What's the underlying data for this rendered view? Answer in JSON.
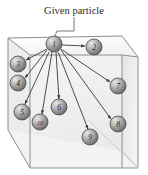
{
  "figure": {
    "title": "Given particle",
    "type": "3d-cube-particle-interaction-diagram",
    "width": 148,
    "height": 175,
    "colors": {
      "background": "#ffffff",
      "cube_stroke": "#8c8c8c",
      "cube_face_front": "#f0f0f0",
      "cube_face_top": "#fbfbfb",
      "cube_face_side": "#e6e6e6",
      "arrow": "#3a3a3a",
      "leader_line": "#6a6a6a",
      "sphere_light": "#dcdcdc",
      "sphere_mid": "#a8a8a8",
      "sphere_dark": "#6f6f6f",
      "sphere_stroke": "#4a4a4a",
      "text": "#2b2b2b"
    }
  },
  "caption": {
    "label": "Given particle",
    "x": 74,
    "y": 12
  },
  "leader": {
    "from_x": 74,
    "from_y": 17,
    "to_x": 56,
    "to_y": 36
  },
  "cube": {
    "front_face": [
      [
        30,
        55
      ],
      [
        122,
        55
      ],
      [
        122,
        168
      ],
      [
        30,
        168
      ]
    ],
    "back_face": [
      [
        8,
        38
      ],
      [
        122,
        36
      ],
      [
        138,
        57
      ],
      [
        138,
        168
      ]
    ],
    "vertices": {
      "front_top_left": [
        30,
        55
      ],
      "front_top_right": [
        122,
        55
      ],
      "front_bottom_left": [
        30,
        168
      ],
      "front_bottom_right": [
        122,
        168
      ],
      "back_top_left": [
        8,
        38
      ],
      "back_top_right": [
        122,
        36
      ],
      "back_bottom_left": [
        8,
        130
      ],
      "back_bottom_right": [
        138,
        57
      ]
    }
  },
  "source_node": {
    "id": "1",
    "label": "1",
    "cx": 54,
    "cy": 44,
    "r": 8
  },
  "target_nodes": [
    {
      "id": "2",
      "label": "2",
      "cx": 94,
      "cy": 47,
      "r": 8
    },
    {
      "id": "3",
      "label": "3",
      "cx": 18,
      "cy": 64,
      "r": 8
    },
    {
      "id": "4",
      "label": "4",
      "cx": 18,
      "cy": 83,
      "r": 8
    },
    {
      "id": "5",
      "label": "5",
      "cx": 22,
      "cy": 112,
      "r": 8
    },
    {
      "id": "6",
      "label": "6",
      "cx": 59,
      "cy": 107,
      "r": 8
    },
    {
      "id": "7",
      "label": "7",
      "cx": 118,
      "cy": 86,
      "r": 8
    },
    {
      "id": "8",
      "label": "8",
      "cx": 118,
      "cy": 124,
      "r": 8
    },
    {
      "id": "9",
      "label": "9",
      "cx": 90,
      "cy": 137,
      "r": 8
    },
    {
      "id": "10",
      "label": "10",
      "cx": 40,
      "cy": 122,
      "r": 8
    }
  ],
  "arrows": [
    {
      "from": "1",
      "to": "2"
    },
    {
      "from": "1",
      "to": "3"
    },
    {
      "from": "1",
      "to": "4"
    },
    {
      "from": "1",
      "to": "5"
    },
    {
      "from": "1",
      "to": "6"
    },
    {
      "from": "1",
      "to": "7"
    },
    {
      "from": "1",
      "to": "8"
    },
    {
      "from": "1",
      "to": "9"
    },
    {
      "from": "1",
      "to": "10"
    }
  ]
}
